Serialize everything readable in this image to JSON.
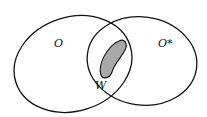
{
  "diagram": {
    "sets": [
      {
        "label": "O",
        "description": "left ellipse"
      },
      {
        "label": "O*",
        "description": "right ellipse"
      }
    ],
    "region": {
      "label": "W",
      "description": "shaded region inside intersection of O and O*"
    },
    "colors": {
      "stroke": "#111111",
      "fill_region": "#a8a8a8",
      "background": "#ffffff"
    }
  }
}
